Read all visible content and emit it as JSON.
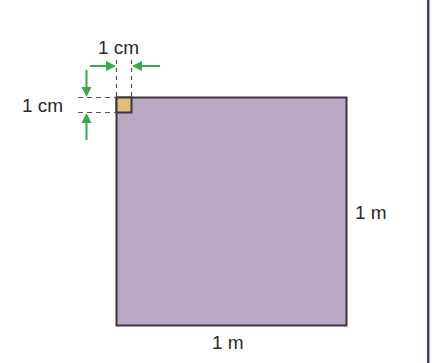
{
  "diagram": {
    "large_square": {
      "side_label_right": "1 m",
      "side_label_bottom": "1 m",
      "fill": "#B9A9C3",
      "stroke": "#3a3540"
    },
    "small_square": {
      "width_label": "1 cm",
      "height_label": "1 cm",
      "fill": "#E2BC7C",
      "stroke": "#3a3540"
    },
    "arrow_color": "#3BA84A",
    "dashed_line_color": "#555555",
    "right_rule_color": "#4A3E6E"
  }
}
